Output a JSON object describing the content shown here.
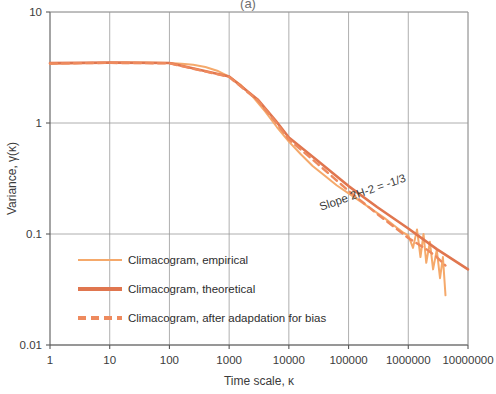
{
  "figure": {
    "caption_partial": "(a)"
  },
  "chart_data": {
    "type": "line",
    "title": "",
    "xlabel": "Time scale, κ",
    "ylabel": "Variance, γ(κ)",
    "xscale": "log",
    "yscale": "log",
    "xlim": [
      1,
      10000000
    ],
    "ylim": [
      0.01,
      10
    ],
    "grid": true,
    "xticks": [
      1,
      10,
      100,
      1000,
      10000,
      100000,
      1000000,
      10000000
    ],
    "xtick_labels": [
      "1",
      "10",
      "100",
      "1000",
      "10000",
      "100000",
      "1000000",
      "10000000"
    ],
    "yticks": [
      0.01,
      0.1,
      1,
      10
    ],
    "ytick_labels": [
      "0.01",
      "0.1",
      "1",
      "10"
    ],
    "legend_position": "lower left",
    "annotations": [
      {
        "text": "Slope 2H-2 = -1/3",
        "x": 180000,
        "y": 0.22,
        "rotation": -19,
        "color": "#3b3b3b"
      }
    ],
    "colors": {
      "empirical": "#F5A96B",
      "theoretical": "#E0764F",
      "adapted": "#EE8A5E",
      "grid": "#9a9a9a",
      "axis": "#595959",
      "text": "#3b3b3b"
    },
    "series": [
      {
        "name": "Climacogram, empirical",
        "style": "solid",
        "width": 2.0,
        "color": "#F5A96B",
        "x": [
          1,
          1.6,
          2.5,
          4,
          6.3,
          10,
          16,
          25,
          40,
          63,
          100,
          160,
          250,
          400,
          630,
          1000,
          1600,
          2500,
          4000,
          6300,
          10000,
          16000,
          25000,
          40000,
          63000,
          100000,
          160000,
          250000,
          400000,
          630000,
          800000,
          1000000,
          1200000,
          1400000,
          1600000,
          1800000,
          2000000,
          2300000,
          2600000,
          3000000,
          3400000,
          3800000,
          4200000
        ],
        "y": [
          3.42,
          3.44,
          3.46,
          3.47,
          3.48,
          3.49,
          3.5,
          3.5,
          3.5,
          3.49,
          3.47,
          3.42,
          3.34,
          3.2,
          2.96,
          2.62,
          2.18,
          1.72,
          1.27,
          0.92,
          0.68,
          0.52,
          0.41,
          0.335,
          0.275,
          0.232,
          0.196,
          0.166,
          0.139,
          0.115,
          0.104,
          0.097,
          0.075,
          0.11,
          0.062,
          0.1,
          0.055,
          0.085,
          0.048,
          0.072,
          0.04,
          0.062,
          0.028
        ]
      },
      {
        "name": "Climacogram, theoretical",
        "style": "solid",
        "width": 2.6,
        "color": "#E0764F",
        "x": [
          1,
          10,
          100,
          1000,
          3000,
          6000,
          10000,
          30000,
          100000,
          300000,
          1000000,
          3000000,
          10000000
        ],
        "y": [
          3.46,
          3.5,
          3.47,
          2.62,
          1.63,
          1.05,
          0.74,
          0.46,
          0.27,
          0.175,
          0.112,
          0.073,
          0.048
        ]
      },
      {
        "name": "Climacogram, after adapdation for bias",
        "style": "dashed",
        "width": 2.4,
        "color": "#EE8A5E",
        "x": [
          1,
          10,
          100,
          1000,
          3000,
          6000,
          10000,
          30000,
          100000,
          300000,
          1000000,
          2000000,
          3000000,
          4200000
        ],
        "y": [
          3.44,
          3.48,
          3.45,
          2.6,
          1.6,
          1.02,
          0.71,
          0.43,
          0.245,
          0.152,
          0.092,
          0.073,
          0.062,
          0.052
        ]
      }
    ]
  },
  "legend": {
    "items": [
      {
        "label": "Climacogram, empirical",
        "color": "#F5A96B",
        "style": "solid",
        "thickness": 2
      },
      {
        "label": "Climacogram, theoretical",
        "color": "#E0764F",
        "style": "solid",
        "thickness": 4
      },
      {
        "label": "Climacogram, after adapdation for bias",
        "color": "#EE8A5E",
        "style": "dashed",
        "thickness": 4
      }
    ]
  }
}
